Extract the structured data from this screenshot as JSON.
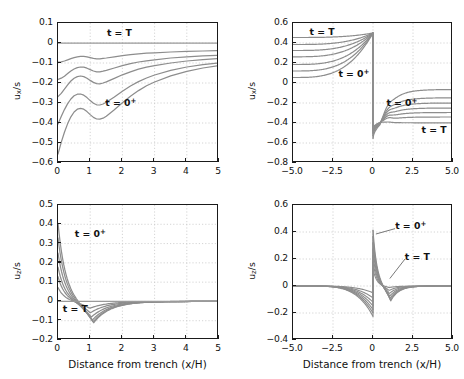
{
  "figure": {
    "background": "#ffffff",
    "axis_color": "#1a1a1a",
    "grid_color": "#c9c9c9",
    "curve_color": "#8d8d8d",
    "curve_color_dark": "#6f6f6f"
  },
  "chart_data": [
    {
      "id": "top-left",
      "type": "line",
      "title": "",
      "xlabel": "",
      "ylabel": "u_x/s",
      "ylabel_base": "u",
      "ylabel_sub": "x",
      "ylabel_suffix": "/s",
      "xlim": [
        0,
        5
      ],
      "ylim": [
        -0.6,
        0.1
      ],
      "xticks": [
        0,
        1,
        2,
        3,
        4,
        5
      ],
      "xtick_labels": [
        "0",
        "1",
        "2",
        "3",
        "4",
        "5"
      ],
      "yticks": [
        0.1,
        0,
        -0.1,
        -0.2,
        -0.3,
        -0.4,
        -0.5,
        -0.6
      ],
      "ytick_labels": [
        "0.1",
        "0",
        "-0.1",
        "-0.2",
        "-0.3",
        "-0.4",
        "-0.5",
        "-0.6"
      ],
      "grid": true,
      "annotations": [
        {
          "text": "t = T",
          "sup": "",
          "x": 1.55,
          "y": 0.045
        },
        {
          "text": "t = 0",
          "sup": "+",
          "x": 1.5,
          "y": -0.305
        }
      ],
      "series": [
        {
          "name": "t = T",
          "x": [
            0,
            0.1,
            0.2,
            0.3,
            0.4,
            0.5,
            0.6,
            0.7,
            0.8,
            0.9,
            1.0,
            1.1,
            1.2,
            1.3,
            1.4,
            1.5,
            1.75,
            2.0,
            2.25,
            2.5,
            2.75,
            3.0,
            3.5,
            4.0,
            4.5,
            5.0
          ],
          "y": [
            0,
            0,
            0,
            0,
            0,
            0,
            0,
            0,
            0,
            0,
            0,
            0,
            0,
            0,
            0,
            0,
            0,
            0,
            0,
            0,
            0,
            0,
            0,
            0,
            0,
            0
          ]
        },
        {
          "name": "curve2",
          "x": [
            0,
            0.1,
            0.2,
            0.3,
            0.4,
            0.5,
            0.6,
            0.7,
            0.8,
            0.9,
            1.0,
            1.1,
            1.2,
            1.3,
            1.4,
            1.5,
            1.75,
            2.0,
            2.25,
            2.5,
            2.75,
            3.0,
            3.5,
            4.0,
            4.5,
            5.0
          ],
          "y": [
            -0.096,
            -0.094,
            -0.09,
            -0.084,
            -0.078,
            -0.073,
            -0.069,
            -0.067,
            -0.067,
            -0.069,
            -0.073,
            -0.077,
            -0.079,
            -0.079,
            -0.077,
            -0.075,
            -0.069,
            -0.063,
            -0.058,
            -0.054,
            -0.051,
            -0.049,
            -0.045,
            -0.042,
            -0.04,
            -0.038
          ]
        },
        {
          "name": "curve3",
          "x": [
            0,
            0.1,
            0.2,
            0.3,
            0.4,
            0.5,
            0.6,
            0.7,
            0.8,
            0.9,
            1.0,
            1.1,
            1.2,
            1.3,
            1.4,
            1.5,
            1.75,
            2.0,
            2.25,
            2.5,
            2.75,
            3.0,
            3.5,
            4.0,
            4.5,
            5.0
          ],
          "y": [
            -0.182,
            -0.176,
            -0.166,
            -0.153,
            -0.14,
            -0.13,
            -0.123,
            -0.12,
            -0.121,
            -0.126,
            -0.133,
            -0.14,
            -0.144,
            -0.144,
            -0.141,
            -0.137,
            -0.125,
            -0.113,
            -0.103,
            -0.095,
            -0.089,
            -0.084,
            -0.075,
            -0.069,
            -0.064,
            -0.061
          ]
        },
        {
          "name": "curve4",
          "x": [
            0,
            0.1,
            0.2,
            0.3,
            0.4,
            0.5,
            0.6,
            0.7,
            0.8,
            0.9,
            1.0,
            1.1,
            1.2,
            1.3,
            1.4,
            1.5,
            1.75,
            2.0,
            2.25,
            2.5,
            2.75,
            3.0,
            3.5,
            4.0,
            4.5,
            5.0
          ],
          "y": [
            -0.268,
            -0.252,
            -0.231,
            -0.209,
            -0.19,
            -0.176,
            -0.168,
            -0.165,
            -0.168,
            -0.176,
            -0.187,
            -0.197,
            -0.203,
            -0.204,
            -0.2,
            -0.194,
            -0.177,
            -0.159,
            -0.144,
            -0.131,
            -0.121,
            -0.113,
            -0.1,
            -0.09,
            -0.083,
            -0.078
          ]
        },
        {
          "name": "curve5",
          "x": [
            0,
            0.1,
            0.2,
            0.3,
            0.4,
            0.5,
            0.6,
            0.7,
            0.8,
            0.9,
            1.0,
            1.1,
            1.2,
            1.3,
            1.4,
            1.5,
            1.75,
            2.0,
            2.25,
            2.5,
            2.75,
            3.0,
            3.5,
            4.0,
            4.5,
            5.0
          ],
          "y": [
            -0.405,
            -0.368,
            -0.333,
            -0.303,
            -0.28,
            -0.264,
            -0.256,
            -0.255,
            -0.261,
            -0.273,
            -0.288,
            -0.301,
            -0.309,
            -0.31,
            -0.305,
            -0.296,
            -0.27,
            -0.241,
            -0.215,
            -0.193,
            -0.175,
            -0.16,
            -0.137,
            -0.12,
            -0.108,
            -0.099
          ]
        },
        {
          "name": "t = 0+",
          "x": [
            0,
            0.1,
            0.2,
            0.3,
            0.4,
            0.5,
            0.6,
            0.7,
            0.8,
            0.9,
            1.0,
            1.1,
            1.2,
            1.3,
            1.4,
            1.5,
            1.75,
            2.0,
            2.25,
            2.5,
            2.75,
            3.0,
            3.5,
            4.0,
            4.5,
            5.0
          ],
          "y": [
            -0.555,
            -0.497,
            -0.446,
            -0.403,
            -0.369,
            -0.345,
            -0.331,
            -0.327,
            -0.331,
            -0.343,
            -0.358,
            -0.372,
            -0.38,
            -0.381,
            -0.376,
            -0.366,
            -0.334,
            -0.299,
            -0.266,
            -0.238,
            -0.214,
            -0.195,
            -0.164,
            -0.142,
            -0.125,
            -0.113
          ]
        }
      ]
    },
    {
      "id": "top-right",
      "type": "line",
      "title": "",
      "ylabel_base": "u",
      "ylabel_sub": "x",
      "ylabel_suffix": "/s",
      "xlim": [
        -5,
        5
      ],
      "ylim": [
        -0.8,
        0.6
      ],
      "xticks": [
        -5,
        -2.5,
        0,
        2.5,
        5
      ],
      "xtick_labels": [
        "-5.0",
        "-2.5",
        "0",
        "2.5",
        "5.0"
      ],
      "yticks": [
        0.6,
        0.4,
        0.2,
        0,
        -0.2,
        -0.4,
        -0.6,
        -0.8
      ],
      "ytick_labels": [
        "0.6",
        "0.4",
        "0.2",
        "0",
        "-0.2",
        "-0.4",
        "-0.6",
        "-0.8"
      ],
      "grid": true,
      "annotations": [
        {
          "text": "t = T",
          "sup": "",
          "x": -3.9,
          "y": 0.505
        },
        {
          "text": "t = 0",
          "sup": "+",
          "x": -2.1,
          "y": 0.085
        },
        {
          "text": "t = 0",
          "sup": "+",
          "x": 0.9,
          "y": -0.205
        },
        {
          "text": "t = T",
          "sup": "",
          "x": 3.1,
          "y": -0.475
        }
      ],
      "left_branch": [
        {
          "name": "t = T",
          "y0": 0.455,
          "y1": 0.5
        },
        {
          "name": "c2",
          "y0": 0.385,
          "y1": 0.5
        },
        {
          "name": "c3",
          "y0": 0.325,
          "y1": 0.5
        },
        {
          "name": "c4",
          "y0": 0.262,
          "y1": 0.5
        },
        {
          "name": "c5",
          "y0": 0.185,
          "y1": 0.5
        },
        {
          "name": "c6",
          "y0": 0.12,
          "y1": 0.5
        },
        {
          "name": "t = 0+",
          "y0": 0.055,
          "y1": 0.5
        }
      ],
      "right_branch": [
        {
          "name": "t = 0+",
          "y0": -0.555,
          "ymin": -0.415,
          "ydip": -0.255,
          "yend": -0.065
        },
        {
          "name": "c2",
          "y0": -0.53,
          "ymin": -0.405,
          "ydip": -0.285,
          "yend": -0.148
        },
        {
          "name": "c3",
          "y0": -0.51,
          "ymin": -0.4,
          "ydip": -0.31,
          "yend": -0.2
        },
        {
          "name": "c4",
          "y0": -0.495,
          "ymin": -0.398,
          "ydip": -0.33,
          "yend": -0.25
        },
        {
          "name": "c5",
          "y0": -0.48,
          "ymin": -0.396,
          "ydip": -0.348,
          "yend": -0.295
        },
        {
          "name": "c6",
          "y0": -0.465,
          "ymin": -0.394,
          "ydip": -0.365,
          "yend": -0.34
        },
        {
          "name": "t = T",
          "y0": -0.45,
          "ymin": -0.393,
          "ydip": -0.382,
          "yend": -0.398
        }
      ]
    },
    {
      "id": "bottom-left",
      "type": "line",
      "ylabel_base": "u",
      "ylabel_sub": "z",
      "ylabel_suffix": "/s",
      "xlabel": "Distance from trench (x/H)",
      "xlim": [
        0,
        5
      ],
      "ylim": [
        -0.2,
        0.5
      ],
      "xticks": [
        0,
        1,
        2,
        3,
        4,
        5
      ],
      "xtick_labels": [
        "0",
        "1",
        "2",
        "3",
        "4",
        "5"
      ],
      "yticks": [
        0.5,
        0.4,
        0.3,
        0.2,
        0.1,
        0,
        -0.1,
        -0.2
      ],
      "ytick_labels": [
        "0.5",
        "0.4",
        "0.3",
        "0.2",
        "0.1",
        "0",
        "-0.1",
        "-0.2"
      ],
      "grid": true,
      "annotations": [
        {
          "text": "t = 0",
          "sup": "+",
          "x": 0.55,
          "y": 0.345
        },
        {
          "text": "t = T",
          "sup": "",
          "x": 0.18,
          "y": -0.042
        }
      ],
      "series": [
        {
          "name": "t = 0+",
          "y0": 0.405,
          "ymin": -0.112,
          "xmin": 1.1
        },
        {
          "name": "c2",
          "y0": 0.33,
          "ymin": -0.108,
          "xmin": 1.08
        },
        {
          "name": "c3",
          "y0": 0.25,
          "ymin": -0.098,
          "xmin": 1.06
        },
        {
          "name": "c4",
          "y0": 0.178,
          "ymin": -0.082,
          "xmin": 1.03
        },
        {
          "name": "c5",
          "y0": 0.128,
          "ymin": -0.06,
          "xmin": 1.0
        },
        {
          "name": "c6",
          "y0": 0.072,
          "ymin": -0.036,
          "xmin": 0.98
        },
        {
          "name": "t = T",
          "y0": 0.0,
          "ymin": 0.0,
          "xmin": 1.0
        }
      ]
    },
    {
      "id": "bottom-right",
      "type": "line",
      "ylabel_base": "u",
      "ylabel_sub": "z",
      "ylabel_suffix": "/s",
      "xlabel": "Distance from trench (x/H)",
      "xlim": [
        -5,
        5
      ],
      "ylim": [
        -0.4,
        0.6
      ],
      "xticks": [
        -5,
        -2.5,
        0,
        2.5,
        5
      ],
      "xtick_labels": [
        "-5.0",
        "-2.5",
        "0",
        "2.5",
        "5.0"
      ],
      "yticks": [
        0.6,
        0.4,
        0.2,
        0,
        -0.2,
        -0.4
      ],
      "ytick_labels": [
        "0.6",
        "0.4",
        "0.2",
        "0",
        "-0.2",
        "-0.4"
      ],
      "grid": true,
      "annotations": [
        {
          "text": "t = 0",
          "sup": "+",
          "x": 1.45,
          "y": 0.435
        },
        {
          "text": "t = T",
          "sup": "",
          "x": 2.05,
          "y": 0.205
        }
      ],
      "left_branch": [
        {
          "name": "t = 0+",
          "yend": -0.225
        },
        {
          "name": "c2",
          "yend": -0.2
        },
        {
          "name": "c3",
          "yend": -0.175
        },
        {
          "name": "c4",
          "yend": -0.148
        },
        {
          "name": "c5",
          "yend": -0.12
        },
        {
          "name": "c6",
          "yend": -0.088
        },
        {
          "name": "t = T",
          "yend": -0.05
        }
      ],
      "right_branch": [
        {
          "name": "t = 0+",
          "y0": 0.415,
          "ymin": -0.112,
          "xmin": 1.1
        },
        {
          "name": "c2",
          "y0": 0.368,
          "ymin": -0.105,
          "xmin": 1.08
        },
        {
          "name": "c3",
          "y0": 0.322,
          "ymin": -0.092,
          "xmin": 1.06
        },
        {
          "name": "c4",
          "y0": 0.276,
          "ymin": -0.076,
          "xmin": 1.04
        },
        {
          "name": "c5",
          "y0": 0.228,
          "ymin": -0.056,
          "xmin": 1.02
        },
        {
          "name": "c6",
          "y0": 0.178,
          "ymin": -0.034,
          "xmin": 1.0
        },
        {
          "name": "t = T",
          "y0": 0.128,
          "ymin": -0.012,
          "xmin": 0.98
        }
      ]
    }
  ]
}
